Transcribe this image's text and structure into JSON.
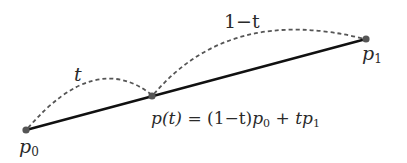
{
  "diagram": {
    "points": {
      "p0": {
        "name": "p",
        "sub": "0"
      },
      "p1": {
        "name": "p",
        "sub": "1"
      },
      "pt": {
        "name": "p(t)"
      }
    },
    "arc_labels": {
      "first": "t",
      "second": "1−t"
    },
    "formula": {
      "lhs": "p(t)",
      "eq": " = ",
      "part1": "(1−t)",
      "p": "p",
      "sub0": "0",
      "plus": " + ",
      "t": "t",
      "sub1": "1"
    },
    "colors": {
      "segment": "#111111",
      "arcs": "#555555",
      "points": "#555555"
    }
  }
}
